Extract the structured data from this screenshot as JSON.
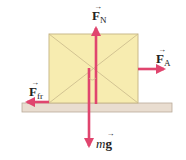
{
  "diagram": {
    "type": "free-body diagram",
    "colors": {
      "box_fill": "#f7ecb0",
      "box_stroke": "#c9b98a",
      "arrow": "#e0456e",
      "ground_fill": "#e9ddd0",
      "ground_stroke": "#b9ab9a"
    },
    "labels": {
      "normal_force": {
        "symbol": "F",
        "subscript": "N",
        "vector": "→"
      },
      "applied_force": {
        "symbol": "F",
        "subscript": "A",
        "vector": "→"
      },
      "friction_force": {
        "symbol": "F",
        "subscript": "fr",
        "vector": "→"
      },
      "weight": {
        "prefix": "m",
        "symbol": "g",
        "vector": "→"
      }
    },
    "forces": [
      {
        "name": "F_N",
        "direction": "up"
      },
      {
        "name": "F_A",
        "direction": "right"
      },
      {
        "name": "F_fr",
        "direction": "left"
      },
      {
        "name": "mg",
        "direction": "down"
      }
    ]
  }
}
